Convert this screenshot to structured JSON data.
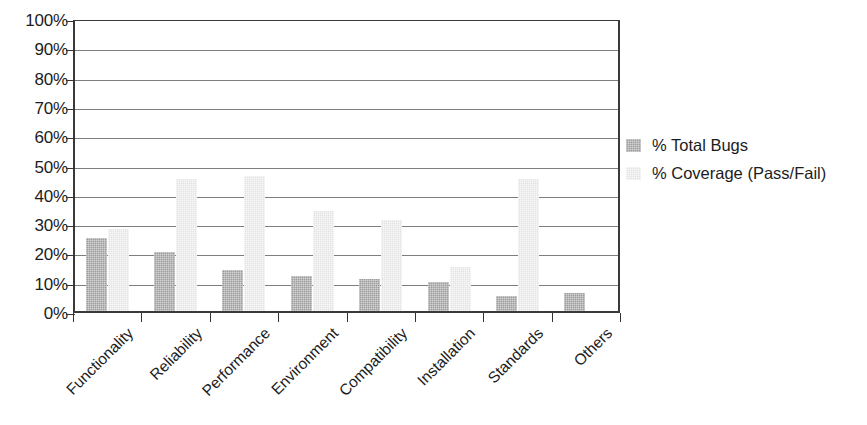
{
  "chart_data": {
    "type": "bar",
    "title": "",
    "subtitle": "",
    "xlabel": "",
    "ylabel": "",
    "categories": [
      "Functionality",
      "Reliability",
      "Performance",
      "Environment",
      "Compatibility",
      "Installation",
      "Standards",
      "Others"
    ],
    "series": [
      {
        "name": "% Total Bugs",
        "color": "#9e9e9e",
        "values": [
          25,
          20,
          14,
          12,
          11,
          10,
          5,
          6
        ]
      },
      {
        "name": "% Coverage (Pass/Fail)",
        "color": "#e3e3e3",
        "values": [
          28,
          45,
          46,
          34,
          31,
          15,
          45,
          null
        ]
      }
    ],
    "ylim": [
      0,
      100
    ],
    "ytick_values": [
      0,
      10,
      20,
      30,
      40,
      50,
      60,
      70,
      80,
      90,
      100
    ],
    "ytick_labels": [
      "100%",
      "90%",
      "80%",
      "70%",
      "60%",
      "50%",
      "40%",
      "30%",
      "20%",
      "10%",
      "0%"
    ],
    "grid": true,
    "grid_axis": "y",
    "legend_position": "right",
    "legend": [
      "% Total Bugs",
      "% Coverage (Pass/Fail)"
    ]
  }
}
